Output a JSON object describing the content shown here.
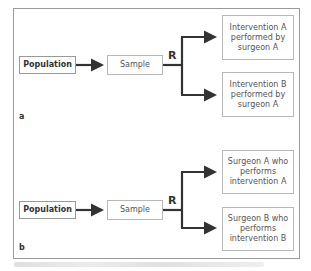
{
  "panel_a": {
    "label": "a",
    "population": "Population",
    "sample": "Sample",
    "randomization": "R",
    "arm_top": "Intervention A performed by surgeon A",
    "arm_bottom": "Intervention B performed by surgeon A"
  },
  "panel_b": {
    "label": "b",
    "population": "Population",
    "sample": "Sample",
    "randomization": "R",
    "arm_top": "Surgeon A who performs intervention A",
    "arm_bottom": "Surgeon B who performs intervention B"
  },
  "colors": {
    "arrow": "#333333",
    "box_border": "#b8b8b8",
    "frame": "#9a9a9a"
  }
}
